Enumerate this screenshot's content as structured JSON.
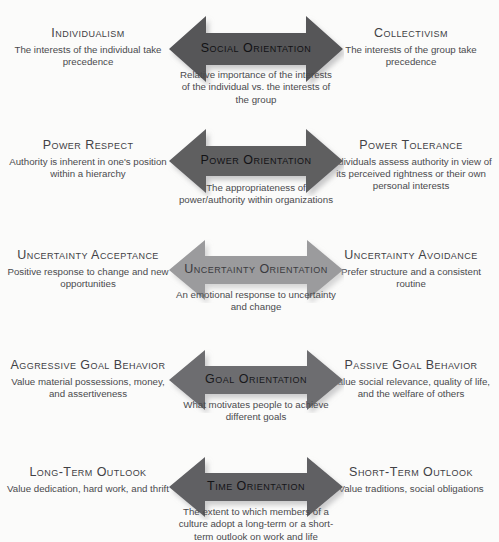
{
  "figure": {
    "background_color": "#fbfbfa",
    "text_color": "#4a4a4d",
    "rows": [
      {
        "id": "social-orientation",
        "arrow_label": "Social Orientation",
        "arrow_color": "#565659",
        "arrow_label_color": "#111114",
        "left_title": "Individualism",
        "left_desc": "The interests of the individual take precedence",
        "right_title": "Collectivism",
        "right_desc": "The interests of the group take precedence",
        "caption": "Relative importance of the interests of the individual vs. the interests of the group"
      },
      {
        "id": "power-orientation",
        "arrow_label": "Power Orientation",
        "arrow_color": "#5e5e61",
        "arrow_label_color": "#121215",
        "left_title": "Power Respect",
        "left_desc": "Authority is inherent in one's position within a hierarchy",
        "right_title": "Power Tolerance",
        "right_desc": "Individuals assess authority in view of its perceived rightness or their own personal interests",
        "caption": "The appropriateness of power/authority within organizations"
      },
      {
        "id": "uncertainty-orientation",
        "arrow_label": "Uncertainty Orientation",
        "arrow_color": "#9b9b9d",
        "arrow_label_color": "#3a3a3e",
        "left_title": "Uncertainty Acceptance",
        "left_desc": "Positive response to change and new opportunities",
        "right_title": "Uncertainty Avoidance",
        "right_desc": "Prefer structure and a consistent routine",
        "caption": "An emotional response to uncertainty and change"
      },
      {
        "id": "goal-orientation",
        "arrow_label": "Goal Orientation",
        "arrow_color": "#6d6d70",
        "arrow_label_color": "#18181b",
        "left_title": "Aggressive Goal Behavior",
        "left_desc": "Value material possessions, money, and assertiveness",
        "right_title": "Passive Goal Behavior",
        "right_desc": "Value social relevance, quality of life, and the welfare of others",
        "caption": "What motivates people to achieve different goals"
      },
      {
        "id": "time-orientation",
        "arrow_label": "Time Orientation",
        "arrow_color": "#616164",
        "arrow_label_color": "#141417",
        "left_title": "Long-Term Outlook",
        "left_desc": "Value dedication, hard work, and thrift",
        "right_title": "Short-Term Outlook",
        "right_desc": "Value traditions, social obligations",
        "caption": "The extent to which members of a culture adopt a long-term or a short-term outlook on work and life"
      }
    ]
  }
}
